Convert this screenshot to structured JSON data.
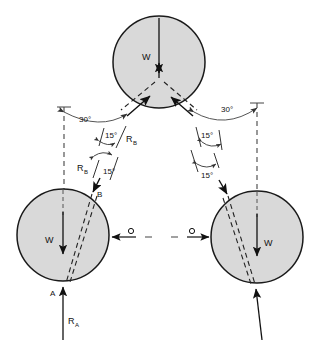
{
  "figure": {
    "background": "#ffffff",
    "circle_fill": "#d9d9d9",
    "circle_stroke": "#1a1a1a",
    "line_color": "#1a1a1a",
    "dash_color": "#333333"
  },
  "bodies": [
    {
      "name": "top-cylinder",
      "cx": 159,
      "cy": 62,
      "r": 46,
      "weight_label": "W"
    },
    {
      "name": "left-cylinder",
      "cx": 63,
      "cy": 235,
      "r": 46,
      "weight_label": "W"
    },
    {
      "name": "right-cylinder",
      "cx": 257,
      "cy": 237,
      "r": 46,
      "weight_label": "W"
    }
  ],
  "labels": {
    "weight_top": "W",
    "weight_left": "W",
    "weight_right": "W",
    "point_a": "A",
    "point_b": "B",
    "reaction_a": "R",
    "reaction_a_sub": "A",
    "reaction_b_upper": "R",
    "reaction_b_upper_sub": "B",
    "reaction_b_lower": "R",
    "reaction_b_lower_sub": "B",
    "angle_30_left": "30°",
    "angle_30_right": "30°",
    "angle_15_left_upper": "15°",
    "angle_15_left_lower": "15°",
    "angle_15_right_upper": "15°",
    "angle_15_right_lower": "15°",
    "center_mark_left": "O",
    "center_mark_right": "O"
  },
  "angles": {
    "primary": "30°",
    "secondary": "15°",
    "count_30": 2,
    "count_15": 4
  },
  "annotations": {
    "note_axis_left": "vertical reference axis (dashed)",
    "note_axis_right": "vertical reference axis (dashed)"
  }
}
